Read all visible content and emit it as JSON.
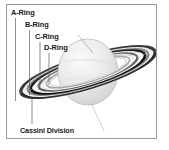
{
  "figure": {
    "background_color": "#ffffff",
    "border_color": "#9a9a9a",
    "label_color": "#1a1a1a",
    "leader_line_color": "#555555",
    "planet_color": "#e8e8e8",
    "ring_dark_color": "#1c1c1c",
    "ring_light_color": "#f2f2f2"
  },
  "labels": {
    "a_ring": "A-Ring",
    "b_ring": "B-Ring",
    "c_ring": "C-Ring",
    "d_ring": "D-Ring",
    "cassini_division": "Cassini Division"
  },
  "annotations": [
    {
      "name": "a-ring",
      "text": "A-Ring",
      "leader_from": [
        16,
        18
      ],
      "leader_to": [
        16,
        100
      ]
    },
    {
      "name": "b-ring",
      "text": "B-Ring",
      "leader_from": [
        30,
        30
      ],
      "leader_to": [
        30,
        94
      ]
    },
    {
      "name": "c-ring",
      "text": "C-Ring",
      "leader_from": [
        40,
        42
      ],
      "leader_to": [
        40,
        88
      ]
    },
    {
      "name": "d-ring",
      "text": "D-Ring",
      "leader_from": [
        49,
        53
      ],
      "leader_to": [
        49,
        84
      ]
    },
    {
      "name": "cassini-division",
      "text": "Cassini Division",
      "leader_from": [
        32,
        96
      ],
      "leader_to": [
        32,
        124
      ]
    }
  ],
  "ring_bands": [
    {
      "name": "outer-a-ring",
      "rx": 70,
      "shade": "dark"
    },
    {
      "name": "a-ring",
      "rx": 66,
      "shade": "light"
    },
    {
      "name": "cassini-division",
      "rx": 61,
      "shade": "dark"
    },
    {
      "name": "b-ring-outer",
      "rx": 57,
      "shade": "light"
    },
    {
      "name": "b-ring",
      "rx": 52,
      "shade": "mid"
    },
    {
      "name": "c-ring",
      "rx": 46,
      "shade": "light"
    },
    {
      "name": "d-ring",
      "rx": 40,
      "shade": "faint"
    }
  ],
  "planet": {
    "name": "saturn-body",
    "center": [
      88,
      72
    ],
    "rx": 30,
    "ry": 33
  }
}
